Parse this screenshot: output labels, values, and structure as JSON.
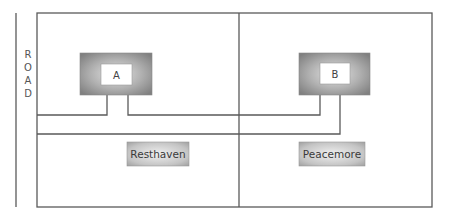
{
  "road": {
    "label": "ROAD",
    "letters": [
      "R",
      "O",
      "A",
      "D"
    ]
  },
  "buildings": [
    {
      "id": "A",
      "label": "A"
    },
    {
      "id": "B",
      "label": "B"
    }
  ],
  "lots": [
    {
      "label": "Resthaven"
    },
    {
      "label": "Peacemore"
    }
  ],
  "colors": {
    "line": "#5a5a5a",
    "building_fill_outer": "#8c8c8c",
    "building_fill_inner": "#d8d8d8",
    "lot_fill_outer": "#a8a8a8",
    "lot_fill_inner": "#e6e6e6"
  }
}
